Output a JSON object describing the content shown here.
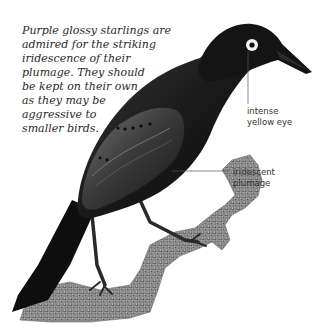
{
  "caption": {
    "lines": [
      "Purple glossy starlings are",
      "admired for the striking",
      "iridescence of their",
      "plumage. They should",
      "be kept on their own",
      "as they may be",
      "aggressive to",
      "smaller birds."
    ]
  },
  "annotations": [
    {
      "id": "eye",
      "lines": [
        "intense",
        "yellow eye"
      ]
    },
    {
      "id": "plumage",
      "lines": [
        "iridescent",
        "plumage"
      ]
    }
  ],
  "illustration": {
    "subject": "purple glossy starling perched on branch",
    "colors": {
      "body": "#161616",
      "sheen": "#5a5a5a",
      "eye_ring": "#f2f2f2",
      "pupil": "#111111",
      "branch": "#8a8a8a",
      "leader_line": "#555555"
    }
  }
}
